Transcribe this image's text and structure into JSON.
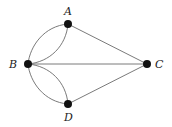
{
  "diagram": {
    "type": "multigraph",
    "nodes": [
      {
        "id": "A",
        "label": "A"
      },
      {
        "id": "B",
        "label": "B"
      },
      {
        "id": "C",
        "label": "C"
      },
      {
        "id": "D",
        "label": "D"
      }
    ],
    "edges": [
      {
        "from": "A",
        "to": "B",
        "style": "curve-outer"
      },
      {
        "from": "A",
        "to": "B",
        "style": "curve-inner"
      },
      {
        "from": "B",
        "to": "D",
        "style": "curve-outer"
      },
      {
        "from": "B",
        "to": "D",
        "style": "curve-inner"
      },
      {
        "from": "A",
        "to": "C",
        "style": "straight"
      },
      {
        "from": "B",
        "to": "C",
        "style": "straight"
      },
      {
        "from": "D",
        "to": "C",
        "style": "straight"
      }
    ],
    "colors": {
      "edge": "#6b6b6b",
      "node": "#111111",
      "label": "#222222"
    }
  }
}
